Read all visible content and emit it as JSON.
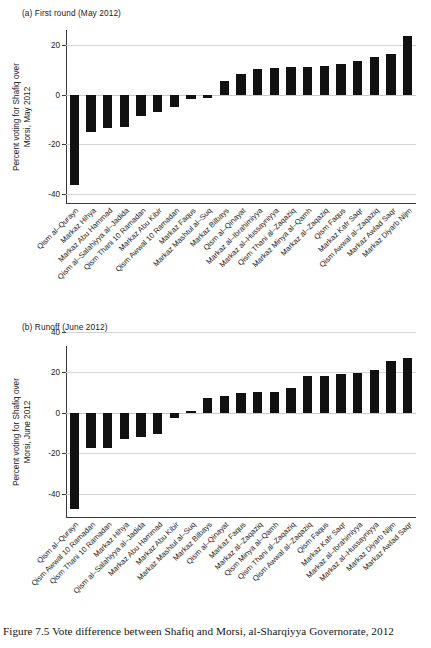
{
  "figure": {
    "caption": "Figure 7.5  Vote difference between Shafiq and Morsi, al-Sharqiyya Governorate, 2012"
  },
  "panels": [
    {
      "key": "a",
      "title": "(a) First round (May 2012)",
      "ylabel_line1": "Percent voting for Shafiq over",
      "ylabel_line2": "Morsi, May 2012"
    },
    {
      "key": "b",
      "title": "(b) Runoff (June 2012)",
      "ylabel_line1": "Percent voting for Shafiq over",
      "ylabel_line2": "Morsi, June 2012"
    }
  ],
  "chart_data": [
    {
      "type": "bar",
      "title": "(a) First round (May 2012)",
      "xlabel": "",
      "ylabel": "Percent voting for Shafiq over Morsi, May 2012",
      "ylim": [
        -44,
        26
      ],
      "yticks": [
        20,
        0,
        -20,
        -40
      ],
      "ytick_labels": [
        "20",
        "0",
        "-20",
        "-40"
      ],
      "grid": true,
      "legend": "none",
      "bar_color": "#111111",
      "categories": [
        "Qism al–Qurayn",
        "Markaz Hihya",
        "Markaz Abu Hammad",
        "Qism al–Salahiyya al–Jadida",
        "Qism Thani 10 Ramadan",
        "Markaz Abu Kibir",
        "Qism Awwal 10 Ramadan",
        "Markaz Faqus",
        "Markaz Mashtul al–Suq",
        "Markaz Bilbays",
        "Qism al–Qinayat",
        "Markaz al–Ibrahimiyya",
        "Markaz al–Hussayniyya",
        "Qism Thani al–Zaqaziq",
        "Markaz Minya al–Qamh",
        "Markaz al–Zaqaziq",
        "Qism Faqus",
        "Markaz Kafr Saqr",
        "Qism Awwal al–Zaqaziq",
        "Markaz Awlad Saqr",
        "Markaz Diyarb Nijm"
      ],
      "values": [
        -36.5,
        -15.0,
        -13.5,
        -13.0,
        -8.5,
        -7.0,
        -5.0,
        -1.8,
        -1.2,
        5.5,
        8.2,
        10.4,
        10.7,
        11.2,
        11.2,
        11.6,
        12.3,
        13.7,
        15.1,
        16.5,
        23.4
      ]
    },
    {
      "type": "bar",
      "title": "(b) Runoff (June 2012)",
      "xlabel": "",
      "ylabel": "Percent voting for Shafiq over Morsi, June 2012",
      "ylim": [
        -52,
        33
      ],
      "yticks": [
        40,
        20,
        0,
        -20,
        -40
      ],
      "ytick_labels": [
        "40",
        "20",
        "0",
        "-20",
        "-40"
      ],
      "grid": true,
      "legend": "none",
      "bar_color": "#111111",
      "categories": [
        "Qism al–Qurayn",
        "Qism Awwal 10 Ramadan",
        "Qism Thani 10 Ramadan",
        "Markaz Hihya",
        "Qism al–Salahiyya al–Jadida",
        "Markaz Abu Hammad",
        "Markaz Abu Kibir",
        "Markaz Mashtul al–Suq",
        "Markaz Bilbays",
        "Qism al–Qinayat",
        "Markaz Faqus",
        "Markaz al–Zaqaziq",
        "Qism Minya al–Qamh",
        "Qism Thani al–Zaqaziq",
        "Qism Awwal al–Zaqaziq",
        "Qism Faqus",
        "Markaz Kafr Saqr",
        "Markaz al–Ibrahimiyya",
        "Markaz al–Hussayniyya",
        "Markaz Diyarb Nijm",
        "Markaz Awlad Saqr"
      ],
      "values": [
        -47.5,
        -17.5,
        -17.2,
        -12.8,
        -12.0,
        -10.5,
        -2.5,
        0.9,
        7.3,
        8.4,
        10.0,
        10.1,
        10.4,
        12.2,
        18.2,
        18.3,
        19.0,
        19.7,
        21.2,
        25.4,
        27.1
      ]
    }
  ]
}
